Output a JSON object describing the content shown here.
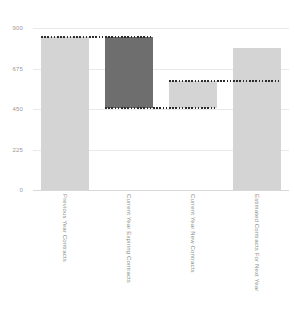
{
  "chart_data": {
    "type": "bar",
    "chart_subtype": "waterfall",
    "title": "",
    "xlabel": "",
    "ylabel": "",
    "ylim": [
      0,
      900
    ],
    "grid": true,
    "legend": "none",
    "yticks": [
      0,
      225,
      450,
      675,
      900
    ],
    "ytick_labels": [
      "0",
      "225",
      "450",
      "675",
      "900"
    ],
    "categories": [
      "Previous Year Contracts",
      "Current Year Expiring Contracts",
      "Current Year New Contracts",
      "Estimated Contracts For Next Year"
    ],
    "values": [
      850,
      -395,
      148,
      790
    ],
    "bar_segments": [
      {
        "label": "Previous Year Contracts",
        "bottom": 0,
        "top": 850,
        "delta": 850,
        "kind": "total",
        "color": "#d4d4d4"
      },
      {
        "label": "Current Year Expiring Contracts",
        "bottom": 455,
        "top": 850,
        "delta": -395,
        "kind": "decrease",
        "color": "#6e6e6e"
      },
      {
        "label": "Current Year New Contracts",
        "bottom": 455,
        "top": 603,
        "delta": 148,
        "kind": "increase",
        "color": "#d4d4d4"
      },
      {
        "label": "Estimated Contracts For Next Year",
        "bottom": 0,
        "top": 790,
        "delta": 790,
        "kind": "total",
        "color": "#d4d4d4"
      }
    ],
    "connectors": [
      {
        "value": 850,
        "from_bar": 0,
        "to_bar": 1
      },
      {
        "value": 455,
        "from_bar": 1,
        "to_bar": 2
      },
      {
        "value": 603,
        "from_bar": 2,
        "to_bar": 3
      }
    ],
    "colors": {
      "increase": "#d4d4d4",
      "decrease": "#6e6e6e",
      "total": "#d4d4d4",
      "connector": "#2b2b2b",
      "grid": "#e9e9e9",
      "tick_text": "#9a9a9a",
      "category_text": "#8f8f8f",
      "background": "#ffffff"
    }
  }
}
